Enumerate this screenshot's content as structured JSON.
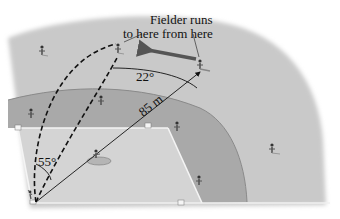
{
  "diagram": {
    "type": "baseball-field-geometry",
    "caption": {
      "line1": "Fielder runs",
      "line2": "to here from here"
    },
    "angles": {
      "top_angle": "22°",
      "home_angle": "55°"
    },
    "distance_label": "85 m",
    "colors": {
      "outfield": "#c9c9c9",
      "infield_dirt": "#a9a9a9",
      "infield_grass": "#d2d2d2",
      "foul_line": "#f4f4f4",
      "ink": "#111111",
      "arrow": "#555555"
    },
    "players": [
      {
        "role": "left-fielder"
      },
      {
        "role": "fielder-start"
      },
      {
        "role": "fielder-end"
      },
      {
        "role": "shortstop"
      },
      {
        "role": "third-baseman"
      },
      {
        "role": "second-baseman"
      },
      {
        "role": "first-baseman"
      },
      {
        "role": "right-fielder"
      },
      {
        "role": "pitcher"
      },
      {
        "role": "batter"
      }
    ]
  }
}
